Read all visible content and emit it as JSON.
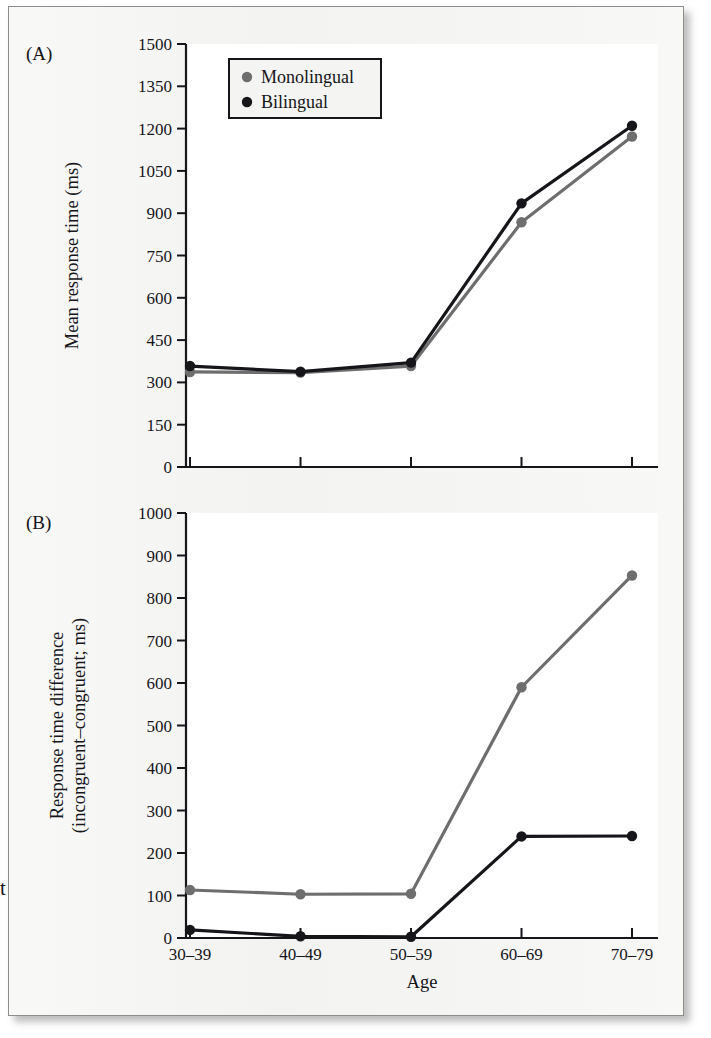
{
  "figure": {
    "background_color": "#f2f2f0",
    "plot_background_color": "#ffffff",
    "stray_margin_glyph": "t"
  },
  "legend": {
    "position": "top-left-inside-panel-A",
    "entries": [
      {
        "label": "Monolingual",
        "color": "#6e6e6e",
        "marker": "filled-circle"
      },
      {
        "label": "Bilingual",
        "color": "#16161a",
        "marker": "filled-circle"
      }
    ]
  },
  "panels": [
    {
      "id": "A",
      "label": "(A)"
    },
    {
      "id": "B",
      "label": "(B)"
    }
  ],
  "chart_data": [
    {
      "type": "line",
      "panel": "A",
      "title": "",
      "xlabel": "",
      "ylabel": "Mean response time (ms)",
      "categories": [
        "30–39",
        "40–49",
        "50–59",
        "60–69",
        "70–79"
      ],
      "yticks": [
        0,
        150,
        300,
        450,
        600,
        750,
        900,
        1050,
        1200,
        1350,
        1500
      ],
      "ylim": [
        0,
        1500
      ],
      "grid": false,
      "legend_position": "inside-top-left",
      "series": [
        {
          "name": "Monolingual",
          "color": "#6e6e6e",
          "values": [
            337,
            335,
            358,
            868,
            1172
          ]
        },
        {
          "name": "Bilingual",
          "color": "#16161a",
          "values": [
            358,
            338,
            370,
            935,
            1210
          ]
        }
      ]
    },
    {
      "type": "line",
      "panel": "B",
      "title": "",
      "xlabel": "Age",
      "ylabel": "Response time difference (incongruent–congruent; ms)",
      "ylabel_line1": "Response time difference",
      "ylabel_line2": "(incongruent–congruent; ms)",
      "categories": [
        "30–39",
        "40–49",
        "50–59",
        "60–69",
        "70–79"
      ],
      "yticks": [
        0,
        100,
        200,
        300,
        400,
        500,
        600,
        700,
        800,
        900,
        1000
      ],
      "ylim": [
        0,
        1000
      ],
      "grid": false,
      "legend_position": "none",
      "series": [
        {
          "name": "Monolingual",
          "color": "#6e6e6e",
          "values": [
            113,
            103,
            104,
            590,
            853
          ]
        },
        {
          "name": "Bilingual",
          "color": "#16161a",
          "values": [
            19,
            4,
            3,
            239,
            240
          ]
        }
      ]
    }
  ]
}
